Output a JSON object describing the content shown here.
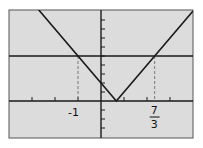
{
  "chart_data": {
    "type": "line",
    "title": "",
    "xlabel": "",
    "ylabel": "",
    "xlim": [
      -4.2,
      4.0
    ],
    "ylim": [
      -4,
      10
    ],
    "x_tick_step": 1,
    "y_tick_step": 1,
    "grid": false,
    "series": [
      {
        "name": "y = |3x - 2|",
        "points": [
          [
            -3.0,
            11
          ],
          [
            0.6667,
            0
          ],
          [
            4.0,
            10
          ]
        ]
      },
      {
        "name": "y = 5",
        "points": [
          [
            -4.2,
            5
          ],
          [
            4.0,
            5
          ]
        ]
      }
    ],
    "annotations": [
      {
        "x": -1,
        "y": 5,
        "label": "-1",
        "dashed_drop": true
      },
      {
        "x": 2.3333,
        "y": 5,
        "label_num": "7",
        "label_den": "3",
        "dashed_drop": true
      }
    ],
    "colors": {
      "background": "#dcdcdc",
      "line": "#1a1a1a",
      "frame": "#555555"
    }
  },
  "labels": {
    "neg_one": "-1",
    "frac_num": "7",
    "frac_den": "3"
  }
}
